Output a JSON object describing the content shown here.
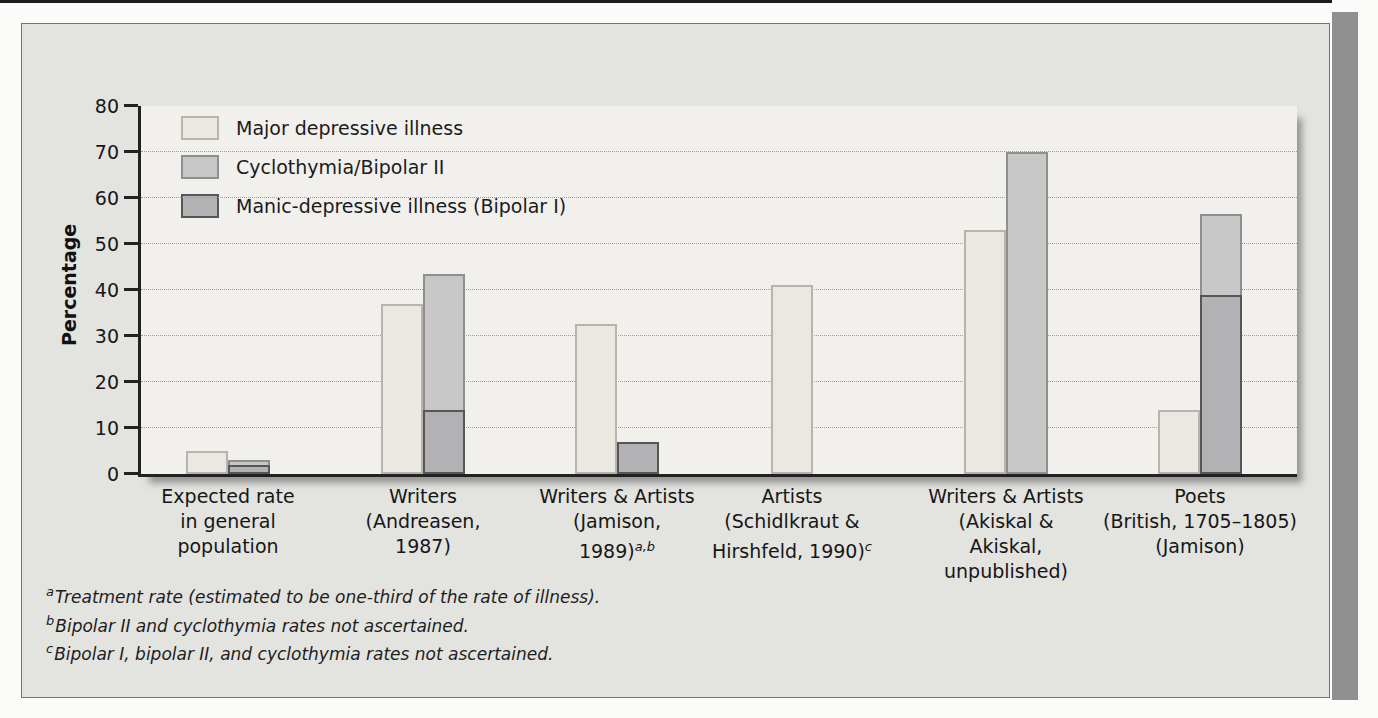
{
  "colors": {
    "panel_bg": "#e3e3e0",
    "plot_bg": "#f1f0ed",
    "page_edge": "#909090",
    "axis": "#222222",
    "bar_major_fill": "#ebe8e1",
    "bar_cyclo_fill": "#c7c7c7",
    "bar_bipolar_fill": "#b2b2b4"
  },
  "chart_data": {
    "type": "bar",
    "title": "",
    "xlabel": "",
    "ylabel": "Percentage",
    "ylim": [
      0,
      80
    ],
    "yticks": [
      0,
      10,
      20,
      30,
      40,
      50,
      60,
      70,
      80
    ],
    "grid": "horizontal-dotted",
    "legend_position": "top-left-inside",
    "legend": [
      {
        "label": "Major depressive illness",
        "color": "#ebe8e1",
        "border": "#b7b4ad"
      },
      {
        "label": "Cyclothymia/Bipolar II",
        "color": "#c7c7c7",
        "border": "#8f8f8f"
      },
      {
        "label": "Manic-depressive illness (Bipolar I)",
        "color": "#b2b2b4",
        "border": "#565656"
      }
    ],
    "groups": [
      {
        "category_lines": [
          "Expected rate",
          "in general",
          "population"
        ],
        "category_sup": "",
        "values": {
          "major_depressive_illness": 5,
          "cyclothymia_bipolar_ii": 3,
          "manic_depressive_bipolar_i": 2
        }
      },
      {
        "category_lines": [
          "Writers",
          "(Andreasen,",
          "1987)"
        ],
        "category_sup": "",
        "values": {
          "major_depressive_illness": 37,
          "cyclothymia_bipolar_ii": 43.5,
          "manic_depressive_bipolar_i": 14
        }
      },
      {
        "category_lines": [
          "Writers & Artists",
          "(Jamison,",
          "1989)"
        ],
        "category_sup": "a,b",
        "values": {
          "major_depressive_illness": 32.5,
          "cyclothymia_bipolar_ii": null,
          "manic_depressive_bipolar_i": 7
        }
      },
      {
        "category_lines": [
          "Artists",
          "(Schidlkraut &",
          "Hirshfeld, 1990)"
        ],
        "category_sup": "c",
        "values": {
          "major_depressive_illness": 41,
          "cyclothymia_bipolar_ii": null,
          "manic_depressive_bipolar_i": null
        }
      },
      {
        "category_lines": [
          "Writers & Artists",
          "(Akiskal &",
          "Akiskal,",
          "unpublished)"
        ],
        "category_sup": "",
        "values": {
          "major_depressive_illness": 53,
          "cyclothymia_bipolar_ii": 70,
          "manic_depressive_bipolar_i": null
        }
      },
      {
        "category_lines": [
          "Poets",
          "(British, 1705–1805)",
          "(Jamison)"
        ],
        "category_sup": "",
        "values": {
          "major_depressive_illness": 14,
          "cyclothymia_bipolar_ii": 56.5,
          "manic_depressive_bipolar_i": 39
        }
      }
    ],
    "footnotes": [
      {
        "marker": "a",
        "text": "Treatment rate (estimated to be one-third of the rate of illness)."
      },
      {
        "marker": "b",
        "text": "Bipolar II and cyclothymia rates not ascertained."
      },
      {
        "marker": "c",
        "text": "Bipolar I, bipolar II, and cyclothymia rates not ascertained."
      }
    ]
  }
}
